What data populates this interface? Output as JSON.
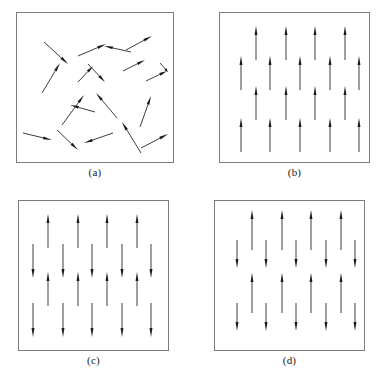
{
  "figure": {
    "width": 385,
    "height": 382,
    "background_color": "#ffffff",
    "box_border_color": "#7b7b80",
    "arrow_color": "#1a1a1a",
    "caption_color": "#1a1a1a"
  },
  "panels": [
    {
      "id": "a",
      "caption": "(a)",
      "ordering": "paramagnetic-random",
      "box": {
        "x": 16,
        "y": 12,
        "width": 158,
        "height": 151
      },
      "caption_y": 166,
      "arrows": [
        {
          "x1": 44,
          "y1": 42,
          "x2": 68,
          "y2": 64
        },
        {
          "x1": 78,
          "y1": 56,
          "x2": 106,
          "y2": 44
        },
        {
          "x1": 131,
          "y1": 52,
          "x2": 104,
          "y2": 46
        },
        {
          "x1": 126,
          "y1": 50,
          "x2": 152,
          "y2": 36
        },
        {
          "x1": 42,
          "y1": 93,
          "x2": 60,
          "y2": 63
        },
        {
          "x1": 78,
          "y1": 82,
          "x2": 93,
          "y2": 66
        },
        {
          "x1": 88,
          "y1": 64,
          "x2": 105,
          "y2": 82
        },
        {
          "x1": 123,
          "y1": 71,
          "x2": 145,
          "y2": 60
        },
        {
          "x1": 146,
          "y1": 81,
          "x2": 167,
          "y2": 71
        },
        {
          "x1": 160,
          "y1": 63,
          "x2": 168,
          "y2": 72
        },
        {
          "x1": 62,
          "y1": 125,
          "x2": 84,
          "y2": 95
        },
        {
          "x1": 95,
          "y1": 112,
          "x2": 70,
          "y2": 105
        },
        {
          "x1": 117,
          "y1": 118,
          "x2": 96,
          "y2": 93
        },
        {
          "x1": 140,
          "y1": 127,
          "x2": 151,
          "y2": 96
        },
        {
          "x1": 23,
          "y1": 133,
          "x2": 52,
          "y2": 140
        },
        {
          "x1": 57,
          "y1": 130,
          "x2": 78,
          "y2": 150
        },
        {
          "x1": 113,
          "y1": 133,
          "x2": 84,
          "y2": 143
        },
        {
          "x1": 141,
          "y1": 153,
          "x2": 122,
          "y2": 122
        },
        {
          "x1": 141,
          "y1": 148,
          "x2": 168,
          "y2": 134
        }
      ]
    },
    {
      "id": "b",
      "caption": "(b)",
      "ordering": "ferromagnetic",
      "box": {
        "x": 219,
        "y": 12,
        "width": 151,
        "height": 151
      },
      "caption_y": 166,
      "rows": [
        {
          "direction": "up",
          "length": 34,
          "y_tail": 60,
          "xs": [
            256,
            286,
            315,
            345
          ]
        },
        {
          "direction": "up",
          "length": 34,
          "y_tail": 90,
          "xs": [
            241,
            270,
            300,
            330,
            359
          ]
        },
        {
          "direction": "up",
          "length": 34,
          "y_tail": 120,
          "xs": [
            256,
            286,
            315,
            345
          ]
        },
        {
          "direction": "up",
          "length": 34,
          "y_tail": 152,
          "xs": [
            241,
            270,
            300,
            330,
            359
          ]
        }
      ]
    },
    {
      "id": "c",
      "caption": "(c)",
      "ordering": "antiferromagnetic",
      "box": {
        "x": 18,
        "y": 200,
        "width": 151,
        "height": 151
      },
      "caption_y": 354,
      "rows": [
        {
          "direction": "up",
          "length": 34,
          "y_tail": 248,
          "xs": [
            48,
            78,
            107,
            137
          ]
        },
        {
          "direction": "down",
          "length": 34,
          "y_tail": 244,
          "xs": [
            33,
            63,
            92,
            122,
            151
          ]
        },
        {
          "direction": "up",
          "length": 34,
          "y_tail": 306,
          "xs": [
            48,
            78,
            107,
            137
          ]
        },
        {
          "direction": "down",
          "length": 34,
          "y_tail": 303,
          "xs": [
            33,
            63,
            92,
            122,
            151
          ]
        }
      ]
    },
    {
      "id": "d",
      "caption": "(d)",
      "ordering": "ferrimagnetic",
      "box": {
        "x": 214,
        "y": 200,
        "width": 151,
        "height": 151
      },
      "caption_y": 354,
      "rows": [
        {
          "direction": "up",
          "length": 40,
          "y_tail": 250,
          "xs": [
            252,
            282,
            311,
            341
          ]
        },
        {
          "direction": "down",
          "length": 28,
          "y_tail": 240,
          "xs": [
            237,
            266,
            296,
            326,
            355
          ]
        },
        {
          "direction": "up",
          "length": 40,
          "y_tail": 313,
          "xs": [
            252,
            282,
            311,
            341
          ]
        },
        {
          "direction": "down",
          "length": 28,
          "y_tail": 303,
          "xs": [
            237,
            266,
            296,
            326,
            355
          ]
        }
      ]
    }
  ]
}
